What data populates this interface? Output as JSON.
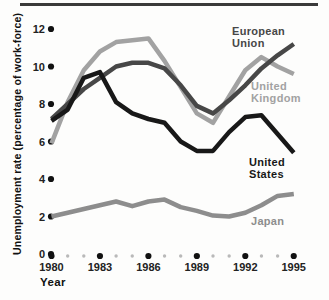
{
  "figure": {
    "ylabel": "Unemployment rate (percentage of work-force)",
    "xlabel": "Year"
  },
  "chart_data": {
    "type": "line",
    "title": "",
    "xlabel": "Year",
    "ylabel": "Unemployment rate (percentage of work-force)",
    "x": [
      1980,
      1981,
      1982,
      1983,
      1984,
      1985,
      1986,
      1987,
      1988,
      1989,
      1990,
      1991,
      1992,
      1993,
      1994,
      1995
    ],
    "x_major_ticks": [
      1980,
      1983,
      1986,
      1989,
      1992,
      1995
    ],
    "y_ticks": [
      0,
      2,
      4,
      6,
      8,
      10,
      12
    ],
    "ylim": [
      0,
      12.8
    ],
    "grid": false,
    "legend": "inline-labels-at-line-ends",
    "axis_style": "dotted-ticks-no-axis-lines",
    "tick_dot_color": "#111111",
    "minor_dot_color": "#b9b9b9",
    "tick_text_color": "#222222",
    "series": [
      {
        "name": "European Union",
        "label_lines": [
          "European",
          "Union"
        ],
        "color": "#474747",
        "values": [
          7.2,
          8.0,
          8.8,
          9.4,
          10.0,
          10.2,
          10.2,
          9.9,
          9.0,
          7.9,
          7.5,
          8.2,
          9.0,
          9.9,
          10.6,
          11.2
        ]
      },
      {
        "name": "United Kingdom",
        "label_lines": [
          "United",
          "Kingdom"
        ],
        "color": "#a2a2a2",
        "values": [
          5.9,
          8.1,
          9.8,
          10.8,
          11.3,
          11.4,
          11.5,
          10.3,
          8.9,
          7.5,
          7.0,
          8.4,
          9.8,
          10.5,
          10.0,
          9.6
        ]
      },
      {
        "name": "United States",
        "label_lines": [
          "United",
          "States"
        ],
        "color": "#181818",
        "values": [
          7.1,
          7.7,
          9.4,
          9.7,
          8.1,
          7.5,
          7.2,
          7.0,
          6.0,
          5.5,
          5.5,
          6.5,
          7.3,
          7.4,
          6.4,
          5.4
        ]
      },
      {
        "name": "Japan",
        "label_lines": [
          "Japan"
        ],
        "color": "#8d8d8d",
        "values": [
          2.0,
          2.2,
          2.4,
          2.6,
          2.8,
          2.55,
          2.8,
          2.9,
          2.5,
          2.3,
          2.05,
          2.0,
          2.2,
          2.6,
          3.1,
          3.2
        ]
      }
    ]
  }
}
